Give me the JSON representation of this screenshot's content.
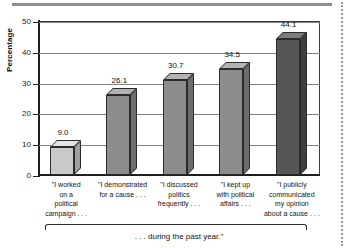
{
  "chart_data": {
    "type": "bar",
    "title": "",
    "subtitle": "",
    "xlabel": "",
    "ylabel": "Percentage",
    "ylim": [
      0,
      50
    ],
    "yticks": [
      0,
      10,
      20,
      30,
      40,
      50
    ],
    "ytick_labels": [
      "0",
      "10",
      "20",
      "30",
      "40",
      "50"
    ],
    "grid": true,
    "legend": "none",
    "style_3d": true,
    "categories": [
      "\"I worked\non a\npolitical\ncampaign . . .",
      "\"I demonstrated\nfor a cause . . .",
      "\"I discussed\npolitics\nfrequently . . .",
      "\"I kept up\nwith political\naffairs . . .",
      "\"I publicly\ncommunicated\nmy opinion\nabout a cause . . ."
    ],
    "values": [
      9.0,
      26.1,
      30.7,
      34.5,
      44.1
    ],
    "value_labels": [
      "9.0",
      "26.1",
      "30.7",
      "34.5",
      "44.1"
    ],
    "bar_colors": [
      "#c9c9c9",
      "#8d8d8d",
      "#8d8d8d",
      "#8d8d8d",
      "#565656"
    ],
    "bar_top_colors": [
      "#e4e4e4",
      "#b3b3b3",
      "#b3b3b3",
      "#b3b3b3",
      "#7d7d7d"
    ],
    "bar_side_colors": [
      "#a0a0a0",
      "#6d6d6d",
      "#6d6d6d",
      "#6d6d6d",
      "#3f3f3f"
    ],
    "annotations": [
      "... during the past year.\""
    ],
    "axis_color": "#1e1e1e",
    "grid_color": "#808080"
  },
  "footer": {
    "caption": ". . . during the past year.\""
  },
  "axis": {
    "y_title": "Percentage"
  }
}
